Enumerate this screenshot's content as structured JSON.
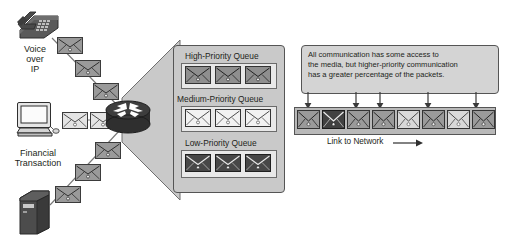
{
  "figure": {
    "type": "network-diagram"
  },
  "sources": [
    {
      "id": "voip",
      "icon": "desk-phone-icon",
      "label_lines": [
        "Voice",
        "over",
        "IP"
      ],
      "packet_style": "dark"
    },
    {
      "id": "financial",
      "icon": "desktop-computer-icon",
      "label_lines": [
        "Financial",
        "Transaction"
      ],
      "packet_style": "light"
    },
    {
      "id": "server",
      "icon": "server-tower-icon",
      "label_lines": [],
      "packet_style": "dark"
    }
  ],
  "router": {
    "icon": "router-icon",
    "label": ""
  },
  "queues": [
    {
      "title": "High-Priority Queue",
      "packet_style": "dark",
      "count": 3
    },
    {
      "title": "Medium-Priority Queue",
      "packet_style": "light",
      "count": 3
    },
    {
      "title": "Low-Priority Queue",
      "packet_style": "dark",
      "count": 3
    }
  ],
  "callout": {
    "lines": [
      "All communication has some access to",
      "the media, but higher-priority communication",
      "has a greater percentage of the packets."
    ],
    "pointer_count": 5
  },
  "link": {
    "label": "Link to Network",
    "direction_arrow": "⟶",
    "packets": [
      {
        "index": 1,
        "style": "mid"
      },
      {
        "index": 2,
        "style": "dark"
      },
      {
        "index": 3,
        "style": "mid"
      },
      {
        "index": 4,
        "style": "mid"
      },
      {
        "index": 5,
        "style": "light"
      },
      {
        "index": 6,
        "style": "mid"
      },
      {
        "index": 7,
        "style": "light"
      },
      {
        "index": 8,
        "style": "mid"
      }
    ]
  },
  "colors": {
    "background": "#ffffff",
    "outline": "#555555",
    "panel_fill": "#c9c9c9",
    "slot_fill": "#e8e8e8",
    "callout_fill": "#d4d4d4",
    "link_fill": "#b9b9b9",
    "envelope_dark": "#4a4a4a",
    "envelope_mid": "#9a9a9a",
    "envelope_light": "#e4e4e4",
    "text": "#231f20",
    "device_dark": "#4c4c4c"
  }
}
